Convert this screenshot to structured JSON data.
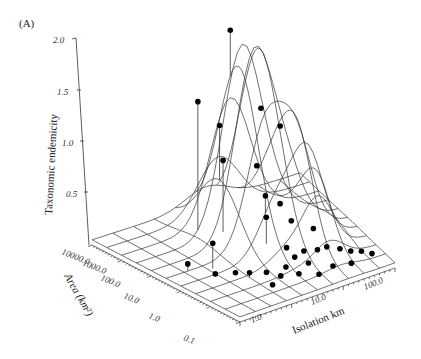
{
  "figure": {
    "panel_label": "(A)"
  },
  "chart_data": {
    "type": "scatter",
    "subtype": "3d-surface-with-scatter",
    "title": "",
    "panel_label": "(A)",
    "zlabel": "Taxonomic endemicity",
    "xlabel": "Isolation km",
    "ylabel": "Area (km²)",
    "z_ticks": [
      "0.5",
      "1.0",
      "1.5",
      "2.0"
    ],
    "x_ticks": [
      "1.0",
      "10.0",
      "100.0"
    ],
    "y_ticks": [
      "0.1",
      "1.0",
      "10.0",
      "100.0",
      "1000.0",
      "10000.0"
    ],
    "zlim": [
      0,
      2.0
    ],
    "x_scale": "log",
    "y_scale": "log",
    "surface": "fitted mesh surface with peak at intermediate area and moderate-high isolation",
    "points_approx": [
      {
        "isolation_km": 1.5,
        "area_km2": 3000,
        "endemicity": 1.95
      },
      {
        "isolation_km": 1.2,
        "area_km2": 2000,
        "endemicity": 1.4
      },
      {
        "isolation_km": 3,
        "area_km2": 1000,
        "endemicity": 1.2
      },
      {
        "isolation_km": 10,
        "area_km2": 500,
        "endemicity": 1.1
      },
      {
        "isolation_km": 8,
        "area_km2": 300,
        "endemicity": 1.0
      },
      {
        "isolation_km": 2,
        "area_km2": 500,
        "endemicity": 0.9
      },
      {
        "isolation_km": 5,
        "area_km2": 200,
        "endemicity": 0.8
      },
      {
        "isolation_km": 1,
        "area_km2": 100,
        "endemicity": 0.7
      },
      {
        "isolation_km": 2,
        "area_km2": 50,
        "endemicity": 0.5
      },
      {
        "isolation_km": 3,
        "area_km2": 30,
        "endemicity": 0.4
      },
      {
        "isolation_km": 0.5,
        "area_km2": 1000,
        "endemicity": 0.2
      },
      {
        "isolation_km": 0.3,
        "area_km2": 3000,
        "endemicity": 0.05
      },
      {
        "isolation_km": 0.4,
        "area_km2": 500,
        "endemicity": 0.05
      },
      {
        "isolation_km": 20,
        "area_km2": 10,
        "endemicity": 0.1
      },
      {
        "isolation_km": 50,
        "area_km2": 5,
        "endemicity": 0.05
      },
      {
        "isolation_km": 80,
        "area_km2": 2,
        "endemicity": 0.02
      }
    ],
    "grid": true,
    "legend": null
  }
}
